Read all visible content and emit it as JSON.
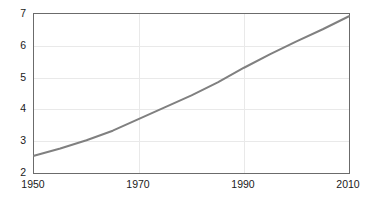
{
  "chart_data": {
    "type": "line",
    "title": "",
    "subtitle": "",
    "xlabel": "",
    "ylabel": "",
    "x": [
      1950,
      1955,
      1960,
      1965,
      1970,
      1975,
      1980,
      1985,
      1990,
      1995,
      2000,
      2005,
      2010
    ],
    "series": [
      {
        "name": "",
        "values": [
          2.54,
          2.77,
          3.03,
          3.33,
          3.7,
          4.07,
          4.44,
          4.85,
          5.31,
          5.74,
          6.14,
          6.52,
          6.93
        ],
        "color": "#808080",
        "line_width": 2
      }
    ],
    "xlim": [
      1950,
      2010
    ],
    "ylim": [
      2,
      7
    ],
    "xticks": [
      1950,
      1970,
      1990,
      2010
    ],
    "xtick_labels": [
      "1950",
      "1970",
      "1990",
      "2010"
    ],
    "yticks": [
      2,
      3,
      4,
      5,
      6,
      7
    ],
    "ytick_labels": [
      "2",
      "3",
      "4",
      "5",
      "6",
      "7"
    ],
    "grid": {
      "horizontal": true,
      "vertical": true,
      "color": "#e9e9e9"
    },
    "legend": {
      "visible": false,
      "position": "none",
      "entries": []
    },
    "frame": {
      "color": "#6b6b6b",
      "visible": true
    },
    "background": "#ffffff",
    "annotations": []
  }
}
